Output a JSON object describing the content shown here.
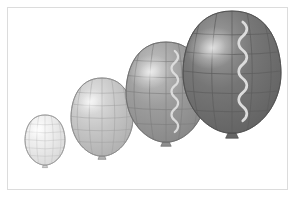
{
  "scene": {
    "title": "Four balloons in graduated sizes and shades",
    "background_color": "#ffffff",
    "frame_color": "#dcdcdc",
    "frame": {
      "x": 7,
      "y": 7,
      "width": 281,
      "height": 183
    },
    "object_count": 4,
    "arrangement": "diagonal, smallest at lower-left to largest at upper-right",
    "outline_color": "#6f6f6f"
  },
  "chart_data": {
    "type": "scatter",
    "title": "Four balloons in graduated sizes and shades",
    "xlabel": "",
    "ylabel": "",
    "categories": [
      "balloon-1",
      "balloon-2",
      "balloon-3",
      "balloon-4"
    ],
    "values": [
      34,
      52,
      68,
      84
    ],
    "series": [
      {
        "name": "body width (px)",
        "values": [
          40,
          62,
          80,
          98
        ]
      },
      {
        "name": "body height (px)",
        "values": [
          50,
          78,
          100,
          122
        ]
      },
      {
        "name": "center x (px)",
        "values": [
          45,
          102,
          166,
          232
        ]
      },
      {
        "name": "center y (px)",
        "values": [
          140,
          117,
          92,
          72
        ]
      }
    ],
    "grid": true,
    "legend": "none"
  },
  "balloons": [
    {
      "id": "balloon-1",
      "label": "smallest balloon",
      "order": 1,
      "fill_light": "#fbfbfb",
      "fill_mid": "#ececec",
      "fill_dark": "#d7d7d7",
      "outline": "#9a9a9a",
      "grid_color": "#b9b9b9",
      "knot_color": "#d2d2d2",
      "knot_outline": "#9a9a9a",
      "has_ribbon": false,
      "ribbon_color": "",
      "cx": 45,
      "cy": 140,
      "rx": 20,
      "ry": 25,
      "highlight_x": 37,
      "highlight_y": 130
    },
    {
      "id": "balloon-2",
      "label": "small-medium balloon",
      "order": 2,
      "fill_light": "#e4e4e4",
      "fill_mid": "#c8c8c8",
      "fill_dark": "#aeaeae",
      "outline": "#8a8a8a",
      "grid_color": "#9d9d9d",
      "knot_color": "#b4b4b4",
      "knot_outline": "#838383",
      "has_ribbon": false,
      "ribbon_color": "",
      "cx": 102,
      "cy": 117,
      "rx": 31,
      "ry": 39,
      "highlight_x": 90,
      "highlight_y": 102
    },
    {
      "id": "balloon-3",
      "label": "medium-large balloon",
      "order": 3,
      "fill_light": "#c4c4c4",
      "fill_mid": "#9d9d9d",
      "fill_dark": "#868686",
      "outline": "#6f6f6f",
      "grid_color": "#7d7d7d",
      "knot_color": "#8e8e8e",
      "knot_outline": "#6a6a6a",
      "has_ribbon": true,
      "ribbon_color": "#dedede",
      "cx": 166,
      "cy": 92,
      "rx": 40,
      "ry": 50,
      "highlight_x": 150,
      "highlight_y": 72
    },
    {
      "id": "balloon-4",
      "label": "largest balloon",
      "order": 4,
      "fill_light": "#a0a0a0",
      "fill_mid": "#767676",
      "fill_dark": "#616161",
      "outline": "#4f4f4f",
      "grid_color": "#5e5e5e",
      "knot_color": "#656565",
      "knot_outline": "#4a4a4a",
      "has_ribbon": true,
      "ribbon_color": "#e2e2e2",
      "cx": 232,
      "cy": 72,
      "rx": 49,
      "ry": 61,
      "highlight_x": 212,
      "highlight_y": 48
    }
  ]
}
